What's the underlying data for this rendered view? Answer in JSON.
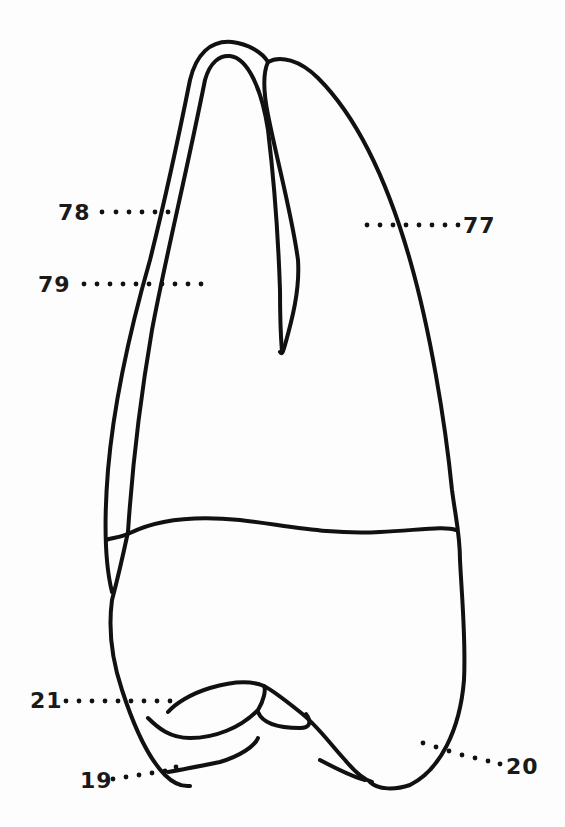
{
  "figure": {
    "colors": {
      "line": "#111111",
      "background": "#fdfdfd",
      "label": "#1a1a1a"
    },
    "labels": [
      {
        "id": "78",
        "text": "78",
        "position": "upper-left, pointing to left root outer wall"
      },
      {
        "id": "79",
        "text": "79",
        "position": "left, pointing into left root"
      },
      {
        "id": "77",
        "text": "77",
        "position": "upper-right, pointing into main root"
      },
      {
        "id": "21",
        "text": "21",
        "position": "lower-left, pointing to crown cusp"
      },
      {
        "id": "19",
        "text": "19",
        "position": "bottom-left, pointing to cusp tip"
      },
      {
        "id": "20",
        "text": "20",
        "position": "bottom-right, pointing to crown contour"
      }
    ]
  }
}
